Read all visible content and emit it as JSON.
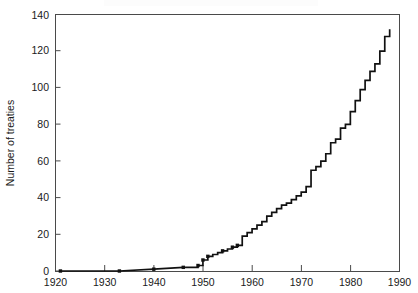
{
  "figure": {
    "width": 418,
    "height": 293,
    "background": "#ffffff",
    "line_color": "#111111",
    "axis_color": "#4a4a4a",
    "text_color": "#1a1a1a"
  },
  "chart_data": {
    "type": "line",
    "subtype": "step-post",
    "title": "",
    "subtitle": "",
    "xlabel": "",
    "ylabel": "Number of treaties",
    "xlim": [
      1920,
      1990
    ],
    "ylim": [
      0,
      140
    ],
    "xticks": [
      1920,
      1930,
      1940,
      1950,
      1960,
      1970,
      1980,
      1990
    ],
    "xtick_labels": [
      "1920",
      "1930",
      "1940",
      "1950",
      "1960",
      "1970",
      "1980",
      "1990"
    ],
    "yticks": [
      0,
      20,
      40,
      60,
      80,
      100,
      120,
      140
    ],
    "ytick_labels": [
      "0",
      "20",
      "40",
      "60",
      "80",
      "100",
      "120",
      "140"
    ],
    "grid": false,
    "legend": null,
    "legend_position": "none",
    "tick_direction": "in",
    "markers_visible_on_early_segment": true,
    "marker_years": [
      1921,
      1933,
      1940,
      1946,
      1949,
      1950,
      1951,
      1954,
      1956,
      1957
    ],
    "series": [
      {
        "name": "Cumulative number of treaties",
        "x": [
          1921,
          1933,
          1940,
          1946,
          1949,
          1950,
          1951,
          1952,
          1953,
          1954,
          1955,
          1956,
          1957,
          1958,
          1959,
          1960,
          1961,
          1962,
          1963,
          1964,
          1965,
          1966,
          1967,
          1968,
          1969,
          1970,
          1971,
          1972,
          1973,
          1974,
          1975,
          1976,
          1977,
          1978,
          1979,
          1980,
          1981,
          1982,
          1983,
          1984,
          1985,
          1986,
          1987,
          1988
        ],
        "values": [
          0,
          0,
          1,
          2,
          3,
          6,
          8,
          9,
          10,
          11,
          12,
          13,
          14,
          19,
          21,
          23,
          25,
          27,
          30,
          32,
          34,
          36,
          37,
          39,
          41,
          43,
          46,
          55,
          57,
          60,
          64,
          70,
          72,
          78,
          80,
          87,
          93,
          99,
          104,
          109,
          113,
          120,
          128,
          132
        ]
      }
    ],
    "annotations": []
  },
  "axes": {
    "ylabel_text": "Number of treaties"
  }
}
